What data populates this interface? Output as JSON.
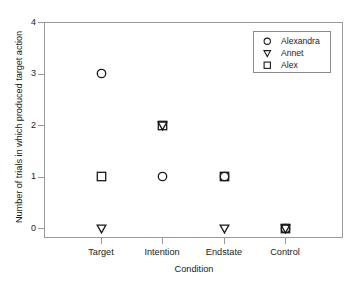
{
  "chart_data": {
    "type": "scatter",
    "title": "",
    "xlabel": "Condition",
    "ylabel": "Number of trials in which produced target action",
    "categories": [
      "Target",
      "Intention",
      "Endstate",
      "Control"
    ],
    "ytick_labels": [
      "0",
      "1",
      "2",
      "3",
      "4"
    ],
    "ylim": [
      -0.2,
      4.0
    ],
    "grid": false,
    "legend_position": "top-right",
    "series": [
      {
        "name": "Alexandra",
        "marker": "circle",
        "values": [
          3,
          1,
          1,
          0
        ]
      },
      {
        "name": "Annet",
        "marker": "triangle-down",
        "values": [
          0,
          2,
          0,
          0
        ]
      },
      {
        "name": "Alex",
        "marker": "square",
        "values": [
          1,
          2,
          1,
          0
        ]
      }
    ]
  },
  "axes": {
    "y_label": "Number of trials in which produced target action",
    "x_label": "Condition",
    "y_ticks": [
      "0",
      "1",
      "2",
      "3",
      "4"
    ],
    "x_ticks": [
      "Target",
      "Intention",
      "Endstate",
      "Control"
    ]
  },
  "legend": {
    "entries": [
      {
        "label": "Alexandra",
        "icon": "circle-marker-icon"
      },
      {
        "label": "Annet",
        "icon": "triangle-down-marker-icon"
      },
      {
        "label": "Alex",
        "icon": "square-marker-icon"
      }
    ]
  },
  "colors": {
    "marker_stroke": "#1a1a1a",
    "frame": "#999999",
    "text": "#1a1a1a",
    "background": "#ffffff"
  }
}
